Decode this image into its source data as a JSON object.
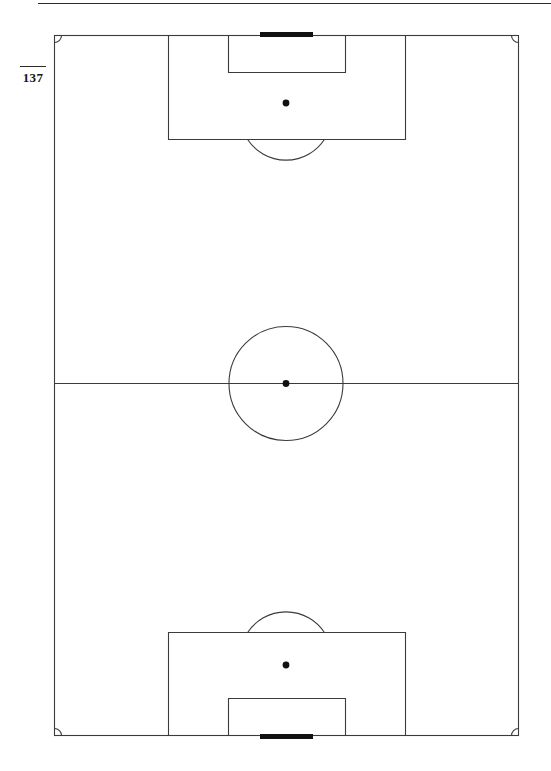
{
  "page": {
    "folio_number": "137",
    "background_color": "#ffffff",
    "width": 551,
    "height": 771,
    "has_head_rule": true
  },
  "figure": {
    "name": "association-football-pitch-plan",
    "orientation": "portrait",
    "line_color": "#3b3b3b",
    "goal_color": "#111111",
    "spot_color": "#111111",
    "line_width": 1,
    "geometry": {
      "touchline_left_x": 54,
      "touchline_right_x": 519,
      "goal_line_top_y": 35,
      "goal_line_bottom_y": 736,
      "halfway_line_y": 383,
      "center_spot_x": 286,
      "center_spot_y": 383,
      "center_circle_radius": 57,
      "corner_arc_radius": 7,
      "penalty_area_left_x": 168,
      "penalty_area_right_x": 405,
      "penalty_area_top_depth_y": 139,
      "penalty_area_bottom_depth_y": 633,
      "goal_area_left_x": 228,
      "goal_area_right_x": 345,
      "goal_area_top_depth_y": 72,
      "goal_area_bottom_depth_y": 698,
      "penalty_spot_top_y": 103,
      "penalty_spot_bottom_y": 665,
      "penalty_spot_radius": 3,
      "penalty_arc_radius": 46,
      "goal_left_x": 260,
      "goal_right_x": 313,
      "goal_thickness": 5
    },
    "elements": [
      {
        "id": "pitch-boundary",
        "label": "Touchlines and goal lines"
      },
      {
        "id": "halfway-line",
        "label": "Halfway line"
      },
      {
        "id": "center-circle",
        "label": "Centre circle"
      },
      {
        "id": "center-spot",
        "label": "Centre spot"
      },
      {
        "id": "penalty-area-top",
        "label": "Penalty area (top)"
      },
      {
        "id": "goal-area-top",
        "label": "Goal area (top)"
      },
      {
        "id": "penalty-spot-top",
        "label": "Penalty spot (top)"
      },
      {
        "id": "penalty-arc-top",
        "label": "Penalty arc (top)"
      },
      {
        "id": "goal-top",
        "label": "Goal (top)"
      },
      {
        "id": "penalty-area-bottom",
        "label": "Penalty area (bottom)"
      },
      {
        "id": "goal-area-bottom",
        "label": "Goal area (bottom)"
      },
      {
        "id": "penalty-spot-bottom",
        "label": "Penalty spot (bottom)"
      },
      {
        "id": "penalty-arc-bottom",
        "label": "Penalty arc (bottom)"
      },
      {
        "id": "goal-bottom",
        "label": "Goal (bottom)"
      },
      {
        "id": "corner-arc-top-left",
        "label": "Corner arc (top left)"
      },
      {
        "id": "corner-arc-top-right",
        "label": "Corner arc (top right)"
      },
      {
        "id": "corner-arc-bottom-left",
        "label": "Corner arc (bottom left)"
      },
      {
        "id": "corner-arc-bottom-right",
        "label": "Corner arc (bottom right)"
      }
    ]
  }
}
